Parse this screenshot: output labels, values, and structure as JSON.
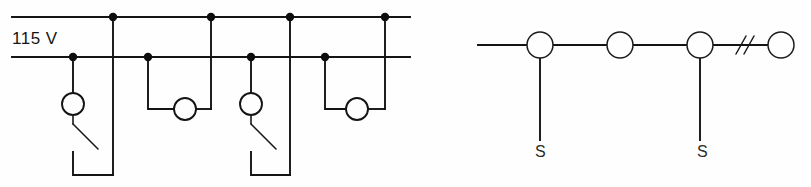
{
  "figure": {
    "background_color": "#fefefe",
    "line_color": "#141414"
  },
  "left_circuit": {
    "name": "parallel-lamp-circuit",
    "voltage_label": "115 V",
    "supply": {
      "hot_rail_y": 17,
      "neutral_rail_y": 57,
      "x_start": 12,
      "x_end": 410
    },
    "hot_junctions_x": [
      113,
      211,
      290,
      385
    ],
    "neutral_junctions_x": [
      73,
      148,
      251,
      325
    ],
    "branches": [
      {
        "id": "branch-1",
        "type": "lamp-with-switch",
        "lamp_cx": 73,
        "lamp_cy": 104,
        "has_switch": true,
        "switch_state": "open",
        "drop_x": 113,
        "loop_bottom_y": 175
      },
      {
        "id": "branch-2",
        "type": "lamp-loop",
        "lamp_cx": 185,
        "lamp_cy": 109,
        "has_switch": false,
        "left_x": 148,
        "right_x": 211,
        "loop_bottom_y": 109
      },
      {
        "id": "branch-3",
        "type": "lamp-with-switch",
        "lamp_cx": 251,
        "lamp_cy": 104,
        "has_switch": true,
        "switch_state": "open",
        "drop_x": 290,
        "loop_bottom_y": 175
      },
      {
        "id": "branch-4",
        "type": "lamp-loop",
        "lamp_cx": 357,
        "lamp_cy": 109,
        "has_switch": false,
        "left_x": 325,
        "right_x": 385,
        "loop_bottom_y": 109
      }
    ]
  },
  "right_circuit": {
    "name": "series-node-chain",
    "feed_line": {
      "x_start": 478,
      "x_end": 527,
      "y": 45
    },
    "nodes": [
      {
        "id": "node-1",
        "cx": 540,
        "cy": 45,
        "r": 13,
        "has_stub": true,
        "stub_bottom_y": 140,
        "stub_label": "S"
      },
      {
        "id": "node-2",
        "cx": 620,
        "cy": 45,
        "r": 13,
        "has_stub": false,
        "stub_label": ""
      },
      {
        "id": "node-3",
        "cx": 700,
        "cy": 45,
        "r": 13,
        "has_stub": true,
        "stub_bottom_y": 140,
        "stub_label": "S"
      },
      {
        "id": "node-4",
        "cx": 781,
        "cy": 45,
        "r": 13,
        "has_stub": false,
        "stub_label": ""
      }
    ],
    "break_symbol": {
      "name": "line-break-double-slash",
      "x": 741,
      "y": 45
    },
    "stub_labels": [
      {
        "text": "S",
        "x": 535,
        "y": 157
      },
      {
        "text": "S",
        "x": 697,
        "y": 157
      }
    ]
  }
}
